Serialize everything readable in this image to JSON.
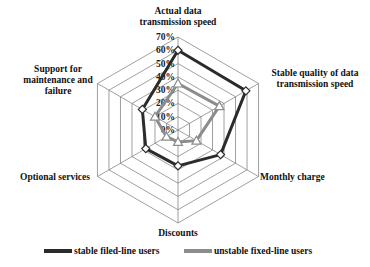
{
  "chart_data": {
    "type": "radar",
    "title": "",
    "categories": [
      "Actual data transmission speed",
      "Stable quality of data transmission speed",
      "Monthly charge",
      "Discounts",
      "Optional services",
      "Support for maintenance and failure"
    ],
    "series": [
      {
        "name": "stable filed-line users",
        "color": "#2b2b2b",
        "marker": "diamond",
        "values": [
          60,
          59,
          37,
          27,
          28,
          31
        ]
      },
      {
        "name": "unstable fixed-line users",
        "color": "#8c8c8c",
        "marker": "triangle",
        "values": [
          35,
          36,
          16,
          9,
          10,
          20
        ]
      }
    ],
    "radial_ticks": [
      "0%",
      "10%",
      "20%",
      "30%",
      "40%",
      "50%",
      "60%",
      "70%"
    ],
    "range": [
      0,
      70
    ],
    "grid": true,
    "legend_position": "bottom"
  },
  "labels": {
    "axis_0": [
      "Actual data",
      "transmission speed"
    ],
    "axis_1": [
      "Stable quality of data",
      "transmission speed"
    ],
    "axis_2": [
      "Monthly charge"
    ],
    "axis_3": [
      "Discounts"
    ],
    "axis_4": [
      "Optional services"
    ],
    "axis_5": [
      "Support for",
      "maintenance and",
      "failure"
    ]
  },
  "legend": {
    "stable": "stable filed-line users",
    "unstable": "unstable fixed-line users"
  }
}
